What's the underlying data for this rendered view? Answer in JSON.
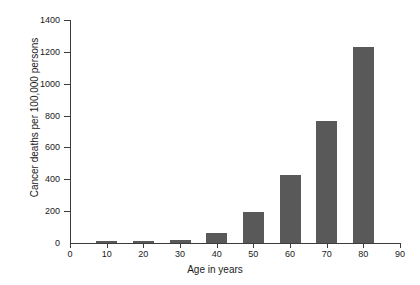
{
  "chart_data": {
    "type": "bar",
    "title": "",
    "xlabel": "Age in years",
    "ylabel": "Cancer deaths per 100,000 persons",
    "categories": [
      10,
      20,
      30,
      40,
      50,
      60,
      70,
      80
    ],
    "values": [
      10,
      12,
      18,
      65,
      195,
      425,
      765,
      1230
    ],
    "xlim": [
      0,
      90
    ],
    "ylim": [
      0,
      1400
    ],
    "x_ticks": [
      0,
      10,
      20,
      30,
      40,
      50,
      60,
      70,
      80,
      90
    ],
    "y_ticks": [
      0,
      200,
      400,
      600,
      800,
      1000,
      1200,
      1400
    ],
    "grid": false,
    "legend": false,
    "bar_color": "#595959",
    "axis_color": "#3c3c3c",
    "background_color": "#ffffff"
  },
  "axes": {
    "x_title": "Age in years",
    "y_title": "Cancer deaths per 100,000 persons",
    "x_tick_labels": [
      "0",
      "10",
      "20",
      "30",
      "40",
      "50",
      "60",
      "70",
      "80",
      "90"
    ],
    "y_tick_labels": [
      "0",
      "200",
      "400",
      "600",
      "800",
      "1000",
      "1200",
      "1400"
    ]
  }
}
